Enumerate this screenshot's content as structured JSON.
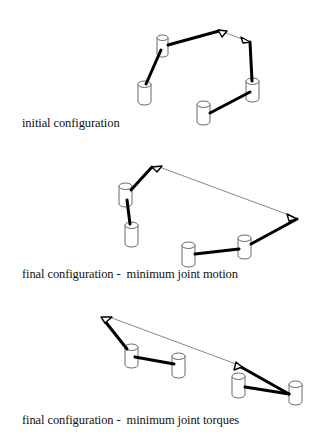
{
  "panels": [
    {
      "id": "initial",
      "caption": "initial configuration",
      "caption_pos": [
        22,
        116
      ],
      "cylinders": [
        {
          "x": 157,
          "y": 35,
          "w": 11,
          "h": 22
        },
        {
          "x": 138,
          "y": 81,
          "w": 13,
          "h": 24
        },
        {
          "x": 246,
          "y": 78,
          "w": 13,
          "h": 24
        },
        {
          "x": 197,
          "y": 101,
          "w": 13,
          "h": 24
        }
      ],
      "thick_links": [
        [
          [
            146,
            84
          ],
          [
            161,
            50
          ]
        ],
        [
          [
            168,
            45
          ],
          [
            219,
            31
          ]
        ],
        [
          [
            250,
            42
          ],
          [
            252,
            81
          ]
        ],
        [
          [
            210,
            113
          ],
          [
            250,
            92
          ]
        ]
      ],
      "thin_links": [
        [
          [
            226,
            33
          ],
          [
            242,
            39
          ]
        ]
      ],
      "triangles": [
        {
          "pts": [
            [
              218,
              30
            ],
            [
              227,
              31
            ],
            [
              222,
              37
            ]
          ]
        },
        {
          "pts": [
            [
              241,
              37
            ],
            [
              250,
              42
            ],
            [
              243,
              43
            ]
          ]
        }
      ]
    },
    {
      "id": "min-motion",
      "caption": "final configuration -  minimum joint motion",
      "caption_pos": [
        22,
        267
      ],
      "cylinders": [
        {
          "x": 119,
          "y": 183,
          "w": 13,
          "h": 24
        },
        {
          "x": 125,
          "y": 222,
          "w": 13,
          "h": 25
        },
        {
          "x": 182,
          "y": 242,
          "w": 13,
          "h": 25
        },
        {
          "x": 238,
          "y": 235,
          "w": 13,
          "h": 24
        }
      ],
      "thick_links": [
        [
          [
            131,
            190
          ],
          [
            152,
            167
          ]
        ],
        [
          [
            127,
            200
          ],
          [
            130,
            224
          ]
        ],
        [
          [
            195,
            254
          ],
          [
            239,
            249
          ]
        ],
        [
          [
            251,
            244
          ],
          [
            297,
            219
          ]
        ]
      ],
      "thin_links": [
        [
          [
            162,
            168
          ],
          [
            289,
            215
          ]
        ]
      ],
      "triangles": [
        {
          "pts": [
            [
              152,
              167
            ],
            [
              162,
              166
            ],
            [
              157,
              172
            ]
          ]
        },
        {
          "pts": [
            [
              287,
              214
            ],
            [
              297,
              219
            ],
            [
              289,
              221
            ]
          ]
        }
      ]
    },
    {
      "id": "min-torques",
      "caption": "final configuration -  minimum joint torques",
      "caption_pos": [
        22,
        413
      ],
      "cylinders": [
        {
          "x": 125,
          "y": 344,
          "w": 13,
          "h": 24
        },
        {
          "x": 172,
          "y": 353,
          "w": 13,
          "h": 25
        },
        {
          "x": 232,
          "y": 373,
          "w": 13,
          "h": 25
        },
        {
          "x": 289,
          "y": 381,
          "w": 13,
          "h": 24
        }
      ],
      "thick_links": [
        [
          [
            104,
            320
          ],
          [
            127,
            349
          ]
        ],
        [
          [
            135,
            357
          ],
          [
            174,
            364
          ]
        ],
        [
          [
            245,
            387
          ],
          [
            289,
            394
          ]
        ],
        [
          [
            241,
            367
          ],
          [
            289,
            394
          ]
        ]
      ],
      "thin_links": [
        [
          [
            112,
            318
          ],
          [
            236,
            364
          ]
        ]
      ],
      "triangles": [
        {
          "pts": [
            [
              101,
              317
            ],
            [
              112,
              317
            ],
            [
              105,
              323
            ]
          ]
        },
        {
          "pts": [
            [
              236,
              362
            ],
            [
              242,
              367
            ],
            [
              234,
              370
            ]
          ]
        }
      ]
    }
  ]
}
